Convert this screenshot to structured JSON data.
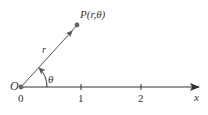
{
  "diagram": {
    "origin_label": "O",
    "point_label": "P(r,θ)",
    "radius_label": "r",
    "angle_label": "θ",
    "axis_label": "x",
    "ticks": [
      "0",
      "1",
      "2"
    ],
    "colors": {
      "line": "#333333",
      "ray": "#555555",
      "point": "#666666"
    }
  }
}
